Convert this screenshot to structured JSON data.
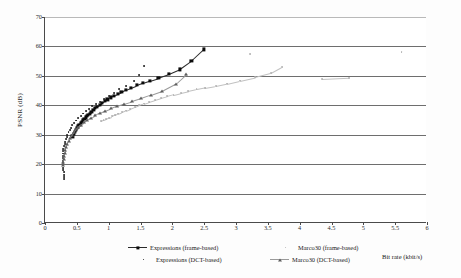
{
  "chart_data": {
    "type": "scatter",
    "title": "",
    "xlabel": "Bit rate (kbit/s)",
    "ylabel": "PSNR (dB)",
    "xlim": [
      0,
      6
    ],
    "ylim": [
      0,
      70
    ],
    "xticks": [
      "0",
      "0.5",
      "1",
      "1.5",
      "2",
      "2.5",
      "3",
      "3.5",
      "4",
      "4.5",
      "5",
      "5.5",
      "6"
    ],
    "yticks": [
      "0",
      "10",
      "20",
      "30",
      "40",
      "50",
      "60",
      "70"
    ],
    "grid": "horizontal",
    "legend_position": "below-plot",
    "series": [
      {
        "name": "Expressions (frame-based)",
        "marker": "square",
        "color": "#0b0b0b",
        "line": true,
        "points": [
          [
            0.43,
            29.4
          ],
          [
            0.45,
            30.2
          ],
          [
            0.47,
            31.0
          ],
          [
            0.49,
            31.6
          ],
          [
            0.5,
            32.2
          ],
          [
            0.52,
            32.8
          ],
          [
            0.54,
            33.4
          ],
          [
            0.56,
            33.9
          ],
          [
            0.58,
            34.4
          ],
          [
            0.6,
            34.9
          ],
          [
            0.62,
            35.4
          ],
          [
            0.64,
            35.9
          ],
          [
            0.66,
            36.3
          ],
          [
            0.68,
            36.8
          ],
          [
            0.7,
            37.2
          ],
          [
            0.73,
            37.8
          ],
          [
            0.76,
            38.4
          ],
          [
            0.79,
            39.0
          ],
          [
            0.82,
            39.5
          ],
          [
            0.86,
            40.1
          ],
          [
            0.9,
            40.8
          ],
          [
            0.94,
            41.4
          ],
          [
            0.98,
            42.0
          ],
          [
            1.03,
            42.7
          ],
          [
            1.08,
            43.3
          ],
          [
            1.14,
            44.0
          ],
          [
            1.2,
            44.6
          ],
          [
            1.27,
            45.3
          ],
          [
            1.35,
            46.0
          ],
          [
            1.44,
            46.8
          ],
          [
            1.54,
            47.6
          ],
          [
            1.65,
            48.4
          ],
          [
            1.78,
            49.3
          ],
          [
            1.95,
            50.6
          ],
          [
            2.12,
            52.2
          ],
          [
            2.3,
            55.0
          ],
          [
            2.5,
            59.0
          ]
        ]
      },
      {
        "name": "Expressions (DCT-based)",
        "marker": "dot",
        "color": "#1b1b1b",
        "line": false,
        "points": [
          [
            0.3,
            14.8
          ],
          [
            0.3,
            15.6
          ],
          [
            0.3,
            16.4
          ],
          [
            0.3,
            17.2
          ],
          [
            0.29,
            18.0
          ],
          [
            0.29,
            18.8
          ],
          [
            0.29,
            19.6
          ],
          [
            0.28,
            20.4
          ],
          [
            0.28,
            21.2
          ],
          [
            0.28,
            22.0
          ],
          [
            0.28,
            22.8
          ],
          [
            0.28,
            23.6
          ],
          [
            0.29,
            24.4
          ],
          [
            0.29,
            25.2
          ],
          [
            0.3,
            26.0
          ],
          [
            0.31,
            26.8
          ],
          [
            0.32,
            27.6
          ],
          [
            0.33,
            28.4
          ],
          [
            0.34,
            29.2
          ],
          [
            0.35,
            30.0
          ],
          [
            0.37,
            30.8
          ],
          [
            0.39,
            31.6
          ],
          [
            0.41,
            32.4
          ],
          [
            0.43,
            33.2
          ],
          [
            0.46,
            34.0
          ],
          [
            0.49,
            34.8
          ],
          [
            0.52,
            35.6
          ],
          [
            0.56,
            36.4
          ],
          [
            0.6,
            37.2
          ],
          [
            0.64,
            38.0
          ],
          [
            0.69,
            38.8
          ],
          [
            0.74,
            39.6
          ],
          [
            0.8,
            40.4
          ],
          [
            0.86,
            41.2
          ],
          [
            0.93,
            42.2
          ],
          [
            1.0,
            43.2
          ],
          [
            1.08,
            44.2
          ],
          [
            1.17,
            45.4
          ],
          [
            1.28,
            46.6
          ],
          [
            1.4,
            48.2
          ],
          [
            1.48,
            50.2
          ],
          [
            1.55,
            53.2
          ]
        ]
      },
      {
        "name": "Marco30 (frame-based)",
        "marker": "dot",
        "color": "#b2b2b2",
        "line": true,
        "points": [
          [
            0.88,
            34.6
          ],
          [
            0.92,
            35.0
          ],
          [
            0.96,
            35.4
          ],
          [
            1.0,
            35.8
          ],
          [
            1.05,
            36.2
          ],
          [
            1.1,
            36.7
          ],
          [
            1.15,
            37.2
          ],
          [
            1.21,
            37.7
          ],
          [
            1.27,
            38.2
          ],
          [
            1.34,
            38.8
          ],
          [
            1.41,
            39.4
          ],
          [
            1.48,
            40.0
          ],
          [
            1.56,
            40.6
          ],
          [
            1.64,
            41.2
          ],
          [
            1.73,
            41.8
          ],
          [
            1.82,
            42.4
          ],
          [
            1.92,
            43.0
          ],
          [
            2.02,
            43.6
          ],
          [
            2.13,
            44.2
          ],
          [
            2.25,
            44.8
          ],
          [
            2.38,
            45.4
          ],
          [
            2.52,
            46.0
          ],
          [
            2.68,
            46.6
          ],
          [
            2.86,
            47.4
          ],
          [
            3.06,
            48.4
          ],
          [
            3.3,
            49.6
          ],
          [
            3.55,
            51.0
          ],
          [
            3.72,
            53.0
          ],
          [
            4.35,
            48.8
          ],
          [
            4.78,
            49.2
          ],
          [
            5.6,
            58.0
          ],
          [
            3.22,
            57.5
          ]
        ]
      },
      {
        "name": "Marco30 (DCT-based)",
        "marker": "triangle",
        "color": "#5d5d5d",
        "line": true,
        "points": [
          [
            0.29,
            19.8
          ],
          [
            0.29,
            20.8
          ],
          [
            0.3,
            21.8
          ],
          [
            0.3,
            22.8
          ],
          [
            0.31,
            23.8
          ],
          [
            0.32,
            24.8
          ],
          [
            0.33,
            25.8
          ],
          [
            0.35,
            26.8
          ],
          [
            0.37,
            27.8
          ],
          [
            0.39,
            28.8
          ],
          [
            0.42,
            29.8
          ],
          [
            0.45,
            30.8
          ],
          [
            0.48,
            31.8
          ],
          [
            0.52,
            32.6
          ],
          [
            0.56,
            33.4
          ],
          [
            0.61,
            34.2
          ],
          [
            0.66,
            35.0
          ],
          [
            0.72,
            35.8
          ],
          [
            0.79,
            36.6
          ],
          [
            0.86,
            37.4
          ],
          [
            0.94,
            38.2
          ],
          [
            1.03,
            39.0
          ],
          [
            1.13,
            39.8
          ],
          [
            1.24,
            40.6
          ],
          [
            1.36,
            41.4
          ],
          [
            1.5,
            42.4
          ],
          [
            1.66,
            43.6
          ],
          [
            1.84,
            45.0
          ],
          [
            2.05,
            47.4
          ],
          [
            2.22,
            50.8
          ]
        ]
      }
    ]
  },
  "legend": {
    "entries": [
      {
        "label": "Expressions (frame-based)",
        "marker": "square-line",
        "color": "#0b0b0b"
      },
      {
        "label": "Expressions (DCT-based)",
        "marker": "dot",
        "color": "#1b1b1b"
      },
      {
        "label": "Marco30 (frame-based)",
        "marker": "dot-faint",
        "color": "#b2b2b2"
      },
      {
        "label": "Marco30 (DCT-based)",
        "marker": "triangle-line",
        "color": "#5d5d5d"
      }
    ]
  }
}
